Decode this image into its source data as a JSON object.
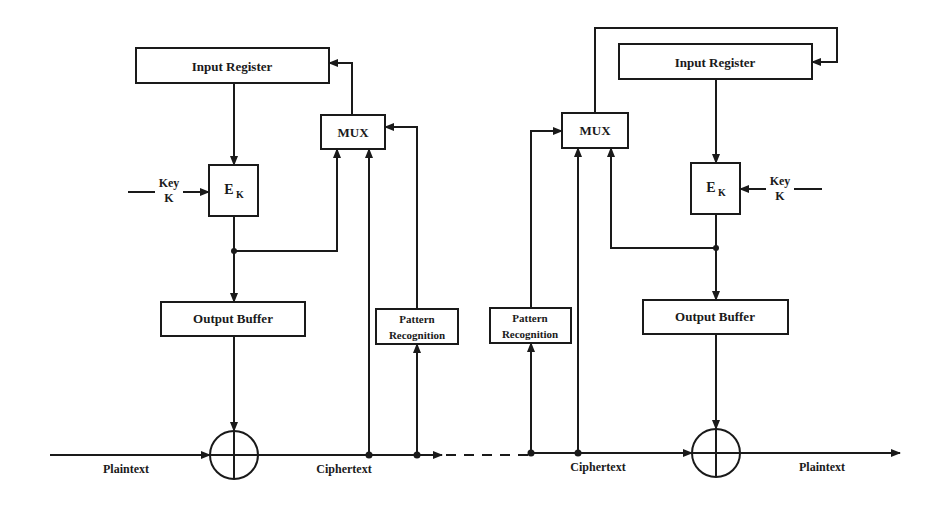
{
  "diagram": {
    "type": "block-diagram",
    "colors": {
      "ink": "#1a1a1a",
      "background": "#ffffff"
    },
    "left": {
      "input_register": "Input Register",
      "mux": "MUX",
      "encrypt": {
        "main": "E",
        "sub": "K"
      },
      "key": {
        "line1": "Key",
        "line2": "K"
      },
      "output_buffer": "Output Buffer",
      "pattern_recognition": {
        "line1": "Pattern",
        "line2": "Recognition"
      },
      "input_label": "Plaintext",
      "output_label": "Ciphertext"
    },
    "right": {
      "input_register": "Input Register",
      "mux": "MUX",
      "encrypt": {
        "main": "E",
        "sub": "K"
      },
      "key": {
        "line1": "Key",
        "line2": "K"
      },
      "output_buffer": "Output Buffer",
      "pattern_recognition": {
        "line1": "Pattern",
        "line2": "Recognition"
      },
      "input_label": "Ciphertext",
      "output_label": "Plaintext"
    }
  }
}
